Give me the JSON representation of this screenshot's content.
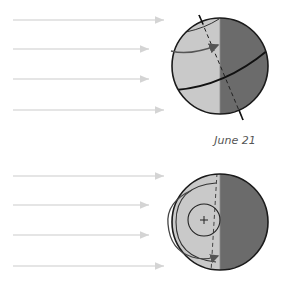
{
  "figure": {
    "caption": "June 21",
    "colors": {
      "sunlit": "#c9c9c9",
      "night": "#6b6b6b",
      "outline": "#1a1a1a",
      "sun_rays": "#d6d6d6",
      "rotation_arrow": "#555555"
    },
    "top_view": {
      "name": "side-view-globe",
      "sun_rays": 4,
      "features": [
        "tilted-axis",
        "equator",
        "arctic-circle",
        "rotation-arrow",
        "day-night-terminator"
      ]
    },
    "bottom_view": {
      "name": "polar-view-globe",
      "sun_rays": 4,
      "features": [
        "north-pole-marker",
        "arctic-circle",
        "axis-line",
        "rotation-arrow",
        "day-night-terminator"
      ]
    }
  }
}
